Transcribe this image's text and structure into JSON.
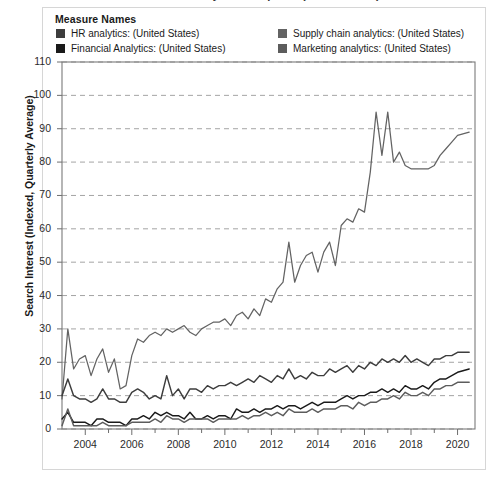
{
  "title": "Search Interest in Business Analytics Disciplines (United States)",
  "legend": {
    "heading": "Measure Names",
    "items": [
      {
        "label": "HR analytics: (United States)",
        "color": "#3d3d3d"
      },
      {
        "label": "Financial Analytics: (United States)",
        "color": "#1a1a1a"
      },
      {
        "label": "Supply chain analytics: (United States)",
        "color": "#636363"
      },
      {
        "label": "Marketing analytics: (United States)",
        "color": "#5c5c5c"
      }
    ]
  },
  "axes": {
    "ylabel": "Search Interest (Indexed, Quarterly Average)",
    "yticks": [
      "0",
      "10",
      "20",
      "30",
      "40",
      "50",
      "60",
      "70",
      "80",
      "90",
      "100",
      "110"
    ],
    "xticks": [
      "2004",
      "2006",
      "2008",
      "2010",
      "2012",
      "2014",
      "2016",
      "2018",
      "2020"
    ]
  },
  "chart_data": {
    "type": "line",
    "title": "Search Interest in Business Analytics Disciplines (United States)",
    "xlabel": "",
    "ylabel": "Search Interest (Indexed, Quarterly Average)",
    "xlim": [
      2003.0,
      2020.75
    ],
    "ylim": [
      0,
      110
    ],
    "grid": true,
    "legend_position": "top",
    "x": [
      2003.0,
      2003.25,
      2003.5,
      2003.75,
      2004.0,
      2004.25,
      2004.5,
      2004.75,
      2005.0,
      2005.25,
      2005.5,
      2005.75,
      2006.0,
      2006.25,
      2006.5,
      2006.75,
      2007.0,
      2007.25,
      2007.5,
      2007.75,
      2008.0,
      2008.25,
      2008.5,
      2008.75,
      2009.0,
      2009.25,
      2009.5,
      2009.75,
      2010.0,
      2010.25,
      2010.5,
      2010.75,
      2011.0,
      2011.25,
      2011.5,
      2011.75,
      2012.0,
      2012.25,
      2012.5,
      2012.75,
      2013.0,
      2013.25,
      2013.5,
      2013.75,
      2014.0,
      2014.25,
      2014.5,
      2014.75,
      2015.0,
      2015.25,
      2015.5,
      2015.75,
      2016.0,
      2016.25,
      2016.5,
      2016.75,
      2017.0,
      2017.25,
      2017.5,
      2017.75,
      2018.0,
      2018.25,
      2018.5,
      2018.75,
      2019.0,
      2019.25,
      2019.5,
      2019.75,
      2020.0,
      2020.5
    ],
    "series": [
      {
        "name": "Supply chain analytics: (United States)",
        "color": "#636363",
        "values": [
          9,
          30,
          18,
          21,
          22,
          16,
          21,
          24,
          17,
          21,
          12,
          13,
          22,
          27,
          26,
          28,
          29,
          28,
          30,
          29,
          30,
          31,
          29,
          28,
          30,
          31,
          32,
          32,
          33,
          31,
          34,
          35,
          33,
          36,
          34,
          39,
          38,
          42,
          44,
          56,
          44,
          49,
          52,
          53,
          47,
          53,
          56,
          49,
          61,
          63,
          62,
          66,
          65,
          77,
          95,
          82,
          95,
          80,
          83,
          79,
          78,
          78,
          78,
          78,
          79,
          82,
          84,
          86,
          88,
          89
        ]
      },
      {
        "name": "HR analytics: (United States)",
        "color": "#3d3d3d",
        "values": [
          10,
          15,
          10,
          9,
          9,
          8,
          9,
          12,
          9,
          9,
          8,
          8,
          11,
          12,
          11,
          9,
          10,
          9,
          16,
          10,
          12,
          9,
          12,
          12,
          11,
          13,
          12,
          13,
          13,
          14,
          13,
          14,
          15,
          14,
          16,
          15,
          14,
          16,
          15,
          18,
          15,
          16,
          15,
          17,
          16,
          16,
          18,
          17,
          18,
          19,
          17,
          19,
          18,
          20,
          19,
          21,
          20,
          21,
          20,
          22,
          20,
          21,
          20,
          19,
          21,
          21,
          22,
          22,
          23,
          23
        ]
      },
      {
        "name": "Financial Analytics: (United States)",
        "color": "#1a1a1a",
        "values": [
          3,
          5,
          2,
          2,
          2,
          1,
          3,
          3,
          2,
          2,
          2,
          1,
          3,
          3,
          4,
          3,
          5,
          4,
          5,
          4,
          4,
          3,
          5,
          3,
          3,
          4,
          3,
          4,
          4,
          3,
          6,
          5,
          5,
          6,
          5,
          6,
          6,
          7,
          6,
          7,
          7,
          6,
          7,
          8,
          7,
          8,
          8,
          8,
          9,
          10,
          9,
          10,
          10,
          11,
          11,
          12,
          11,
          12,
          11,
          13,
          12,
          12,
          13,
          12,
          14,
          15,
          15,
          16,
          17,
          18
        ]
      },
      {
        "name": "Marketing analytics: (United States)",
        "color": "#5c5c5c",
        "values": [
          1,
          6,
          1,
          1,
          1,
          1,
          1,
          2,
          1,
          1,
          1,
          1,
          2,
          2,
          2,
          2,
          3,
          2,
          4,
          3,
          3,
          2,
          3,
          3,
          3,
          3,
          2,
          3,
          3,
          3,
          3,
          4,
          3,
          4,
          4,
          5,
          4,
          5,
          4,
          6,
          5,
          5,
          5,
          6,
          5,
          6,
          6,
          6,
          7,
          7,
          6,
          8,
          7,
          8,
          8,
          9,
          9,
          10,
          9,
          11,
          10,
          10,
          11,
          10,
          12,
          12,
          13,
          13,
          14,
          14
        ]
      }
    ]
  }
}
